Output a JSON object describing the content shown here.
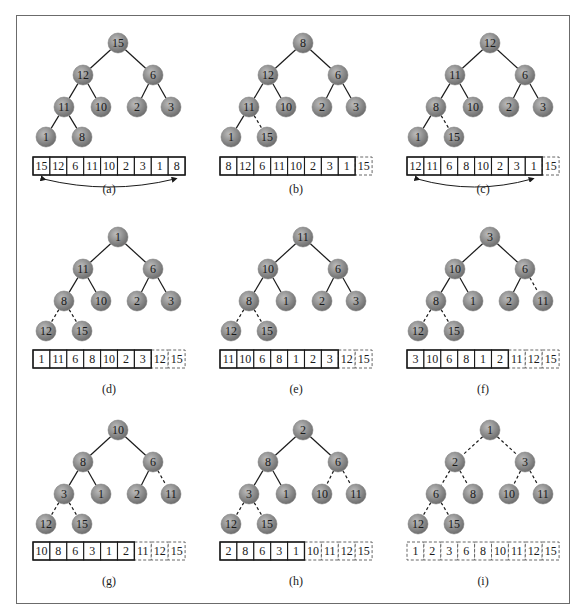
{
  "figure": {
    "node_fill": "#8a8a8a",
    "node_highlight": "#c4c4c4",
    "edge_color": "#1a1a1a",
    "frame_color": "#6b6b6b"
  },
  "panels": [
    {
      "label": "(a)",
      "tree": [
        "15",
        "12",
        "6",
        "11",
        "10",
        "2",
        "3",
        "1",
        "8"
      ],
      "dashed_edges": [],
      "array": [
        "15",
        "12",
        "6",
        "11",
        "10",
        "2",
        "3",
        "1",
        "8"
      ],
      "sorted_count": 0,
      "swap_arrow": true
    },
    {
      "label": "(b)",
      "tree": [
        "8",
        "12",
        "6",
        "11",
        "10",
        "2",
        "3",
        "1",
        "15"
      ],
      "dashed_edges": [
        8
      ],
      "array": [
        "8",
        "12",
        "6",
        "11",
        "10",
        "2",
        "3",
        "1",
        "15"
      ],
      "sorted_count": 1,
      "swap_arrow": false
    },
    {
      "label": "(c)",
      "tree": [
        "12",
        "11",
        "6",
        "8",
        "10",
        "2",
        "3",
        "1",
        "15"
      ],
      "dashed_edges": [
        8
      ],
      "array": [
        "12",
        "11",
        "6",
        "8",
        "10",
        "2",
        "3",
        "1",
        "15"
      ],
      "sorted_count": 1,
      "swap_arrow": true
    },
    {
      "label": "(d)",
      "tree": [
        "1",
        "11",
        "6",
        "8",
        "10",
        "2",
        "3",
        "12",
        "15"
      ],
      "dashed_edges": [
        7,
        8
      ],
      "array": [
        "1",
        "11",
        "6",
        "8",
        "10",
        "2",
        "3",
        "12",
        "15"
      ],
      "sorted_count": 2,
      "swap_arrow": false
    },
    {
      "label": "(e)",
      "tree": [
        "11",
        "10",
        "6",
        "8",
        "1",
        "2",
        "3",
        "12",
        "15"
      ],
      "dashed_edges": [
        7,
        8
      ],
      "array": [
        "11",
        "10",
        "6",
        "8",
        "1",
        "2",
        "3",
        "12",
        "15"
      ],
      "sorted_count": 2,
      "swap_arrow": false
    },
    {
      "label": "(f)",
      "tree": [
        "3",
        "10",
        "6",
        "8",
        "1",
        "2",
        "11",
        "12",
        "15"
      ],
      "dashed_edges": [
        6,
        7,
        8
      ],
      "array": [
        "3",
        "10",
        "6",
        "8",
        "1",
        "2",
        "11",
        "12",
        "15"
      ],
      "sorted_count": 3,
      "swap_arrow": false
    },
    {
      "label": "(g)",
      "tree": [
        "10",
        "8",
        "6",
        "3",
        "1",
        "2",
        "11",
        "12",
        "15"
      ],
      "dashed_edges": [
        6,
        7,
        8
      ],
      "array": [
        "10",
        "8",
        "6",
        "3",
        "1",
        "2",
        "11",
        "12",
        "15"
      ],
      "sorted_count": 3,
      "swap_arrow": false
    },
    {
      "label": "(h)",
      "tree": [
        "2",
        "8",
        "6",
        "3",
        "1",
        "10",
        "11",
        "12",
        "15"
      ],
      "dashed_edges": [
        5,
        6,
        7,
        8
      ],
      "array": [
        "2",
        "8",
        "6",
        "3",
        "1",
        "10",
        "11",
        "12",
        "15"
      ],
      "sorted_count": 4,
      "swap_arrow": false
    },
    {
      "label": "(i)",
      "tree": [
        "1",
        "2",
        "3",
        "6",
        "8",
        "10",
        "11",
        "12",
        "15"
      ],
      "dashed_edges": [
        1,
        2,
        3,
        4,
        5,
        6,
        7,
        8
      ],
      "array": [
        "1",
        "2",
        "3",
        "6",
        "8",
        "10",
        "11",
        "12",
        "15"
      ],
      "sorted_count": 9,
      "swap_arrow": false
    }
  ]
}
